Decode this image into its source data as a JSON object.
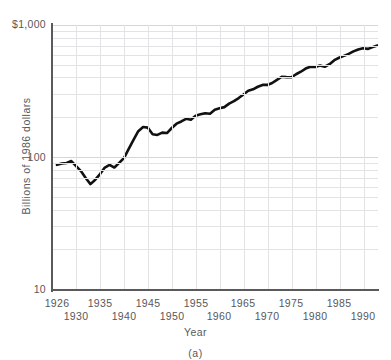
{
  "figure": {
    "clipped_header_text": "",
    "caption": "(a)"
  },
  "axes": {
    "ylabel": "Billions of 1986 dollars",
    "xlabel": "Year",
    "ytick_labels": [
      "$1,000",
      "100",
      "10"
    ],
    "xtick_labels_row1": [
      "1926",
      "1935",
      "1945",
      "1955",
      "1965",
      "1975",
      "1985"
    ],
    "xtick_labels_row2": [
      "1930",
      "1940",
      "1950",
      "1960",
      "1970",
      "1980",
      "1990"
    ]
  },
  "colors": {
    "line": "#111111",
    "grid": "#e3e3e6",
    "axis": "#5a5a5c",
    "text": "#58585a",
    "background": "#ffffff"
  },
  "chart_data": {
    "type": "line",
    "title": "",
    "subtitle": "",
    "xlabel": "Year",
    "ylabel": "Billions of 1986 dollars",
    "yscale": "log",
    "ylim": [
      10,
      1000
    ],
    "xlim": [
      1926,
      1993
    ],
    "grid": true,
    "legend": null,
    "ytick_values": [
      10,
      100,
      1000
    ],
    "ytick_labels": [
      "10",
      "100",
      "$1,000"
    ],
    "xtick_values": [
      1926,
      1930,
      1935,
      1940,
      1945,
      1950,
      1955,
      1960,
      1965,
      1970,
      1975,
      1980,
      1985,
      1990
    ],
    "series": [
      {
        "name": "Real GNP",
        "x": [
          1926,
          1927,
          1928,
          1929,
          1930,
          1931,
          1932,
          1933,
          1934,
          1935,
          1936,
          1937,
          1938,
          1939,
          1940,
          1941,
          1942,
          1943,
          1944,
          1945,
          1946,
          1947,
          1948,
          1949,
          1950,
          1951,
          1952,
          1953,
          1954,
          1955,
          1956,
          1957,
          1958,
          1959,
          1960,
          1961,
          1962,
          1963,
          1964,
          1965,
          1966,
          1967,
          1968,
          1969,
          1970,
          1971,
          1972,
          1973,
          1974,
          1975,
          1976,
          1977,
          1978,
          1979,
          1980,
          1981,
          1982,
          1983,
          1984,
          1985,
          1986,
          1987,
          1988,
          1989,
          1990,
          1991,
          1992,
          1993
        ],
        "y": [
          88,
          90,
          91,
          94,
          86,
          79,
          70,
          63,
          68,
          75,
          84,
          88,
          84,
          91,
          99,
          116,
          136,
          158,
          170,
          168,
          150,
          148,
          154,
          153,
          167,
          180,
          187,
          196,
          193,
          207,
          212,
          216,
          214,
          229,
          235,
          240,
          255,
          266,
          281,
          299,
          319,
          327,
          342,
          353,
          353,
          365,
          385,
          407,
          404,
          403,
          425,
          444,
          469,
          484,
          482,
          494,
          484,
          506,
          543,
          566,
          585,
          605,
          632,
          654,
          667,
          660,
          681,
          700
        ]
      }
    ],
    "annotations": [
      {
        "text": "Great Depression trough",
        "x": 1933,
        "y": 63
      },
      {
        "text": "WWII peak",
        "x": 1944,
        "y": 170
      },
      {
        "text": "Early 1980s recession",
        "x": 1982,
        "y": 484
      }
    ]
  }
}
